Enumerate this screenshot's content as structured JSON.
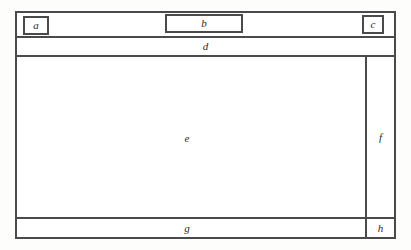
{
  "diagram": {
    "style": {
      "line_color": "#4a4a4a",
      "background_color": "#ffffff",
      "label_color": "#2b2b2b"
    },
    "regions": {
      "a": {
        "label": "a",
        "role": "logo-box"
      },
      "b": {
        "label": "b",
        "role": "header-center-box"
      },
      "c": {
        "label": "c",
        "role": "header-right-box"
      },
      "d": {
        "label": "d",
        "role": "navigation-band"
      },
      "e": {
        "label": "e",
        "role": "main-content-area"
      },
      "f": {
        "label": "f",
        "role": "right-sidebar"
      },
      "g": {
        "label": "g",
        "role": "footer-band"
      },
      "h": {
        "label": "h",
        "role": "footer-right-cell"
      }
    }
  }
}
